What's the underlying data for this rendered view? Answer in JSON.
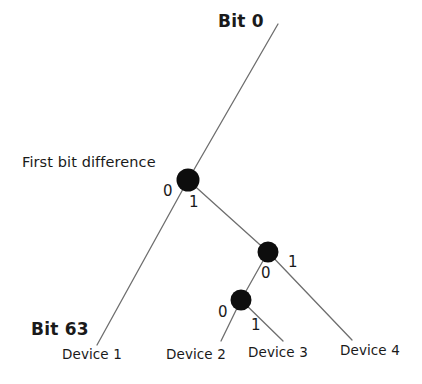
{
  "diagram": {
    "type": "binary-trie-tree",
    "title_top": "Bit 0",
    "title_bottom": "Bit 63",
    "annotation": "First bit difference",
    "colors": {
      "edge": "#6e6e6e",
      "node": "#0d0d0d",
      "text": "#1a1a1a",
      "background": "#ffffff"
    },
    "edge_labels": {
      "n1_left": "0",
      "n1_right": "1",
      "n2_left": "0",
      "n2_right": "1",
      "n3_left": "0",
      "n3_right": "1"
    },
    "leaves": [
      {
        "label": "Device 1"
      },
      {
        "label": "Device 2"
      },
      {
        "label": "Device 3"
      },
      {
        "label": "Device 4"
      }
    ],
    "nodes": [
      {
        "name": "first-bit-difference-node",
        "cx": 188,
        "cy": 180,
        "r": 11.5
      },
      {
        "name": "second-branch-node",
        "cx": 268,
        "cy": 252,
        "r": 10.5
      },
      {
        "name": "third-branch-node",
        "cx": 241,
        "cy": 300,
        "r": 10.5
      }
    ]
  }
}
